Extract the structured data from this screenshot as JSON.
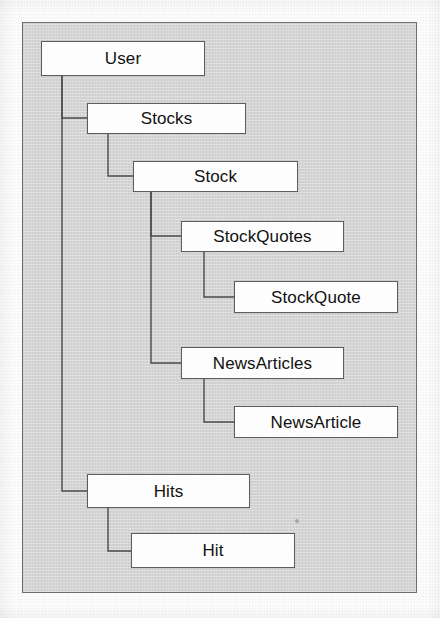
{
  "diagram": {
    "type": "hierarchy-tree",
    "colors": {
      "canvas_background": "#d4d4d4",
      "canvas_border": "#6e6e6e",
      "node_fill": "#fdfdfd",
      "node_border": "#5d5d5d",
      "connector": "#4a4a4a",
      "text": "#111111",
      "page": "#fdfdfd"
    },
    "frame": {
      "x": 22,
      "y": 22,
      "width": 395,
      "height": 571
    },
    "nodes": [
      {
        "id": "user",
        "label": "User",
        "x": 41,
        "y": 41,
        "width": 164,
        "height": 35,
        "depth": 0
      },
      {
        "id": "stocks",
        "label": "Stocks",
        "x": 87,
        "y": 103,
        "width": 159,
        "height": 31,
        "depth": 1
      },
      {
        "id": "stock",
        "label": "Stock",
        "x": 133,
        "y": 161,
        "width": 165,
        "height": 31,
        "depth": 2
      },
      {
        "id": "stockquotes",
        "label": "StockQuotes",
        "x": 181,
        "y": 221,
        "width": 163,
        "height": 31,
        "depth": 3
      },
      {
        "id": "stockquote",
        "label": "StockQuote",
        "x": 234,
        "y": 281,
        "width": 164,
        "height": 32,
        "depth": 4
      },
      {
        "id": "newsarticles",
        "label": "NewsArticles",
        "x": 181,
        "y": 347,
        "width": 163,
        "height": 32,
        "depth": 3
      },
      {
        "id": "newsarticle",
        "label": "NewsArticle",
        "x": 234,
        "y": 406,
        "width": 164,
        "height": 32,
        "depth": 4
      },
      {
        "id": "hits",
        "label": "Hits",
        "x": 87,
        "y": 474,
        "width": 163,
        "height": 34,
        "depth": 1
      },
      {
        "id": "hit",
        "label": "Hit",
        "x": 131,
        "y": 533,
        "width": 164,
        "height": 35,
        "depth": 2
      }
    ],
    "edges": [
      {
        "from": "user",
        "to": "stocks",
        "drop_x": 62,
        "from_y": 76,
        "to_y": 118
      },
      {
        "from": "user",
        "to": "hits",
        "drop_x": 62,
        "from_y": 76,
        "to_y": 491
      },
      {
        "from": "stocks",
        "to": "stock",
        "drop_x": 108,
        "from_y": 134,
        "to_y": 176
      },
      {
        "from": "stock",
        "to": "stockquotes",
        "drop_x": 151,
        "from_y": 192,
        "to_y": 236
      },
      {
        "from": "stock",
        "to": "newsarticles",
        "drop_x": 151,
        "from_y": 192,
        "to_y": 363
      },
      {
        "from": "stockquotes",
        "to": "stockquote",
        "drop_x": 204,
        "from_y": 252,
        "to_y": 297
      },
      {
        "from": "newsarticles",
        "to": "newsarticle",
        "drop_x": 204,
        "from_y": 379,
        "to_y": 422
      },
      {
        "from": "hits",
        "to": "hit",
        "drop_x": 108,
        "from_y": 508,
        "to_y": 551
      }
    ],
    "artifacts": [
      {
        "id": "scan-speck",
        "x": 295,
        "y": 519,
        "size": 4
      }
    ]
  }
}
